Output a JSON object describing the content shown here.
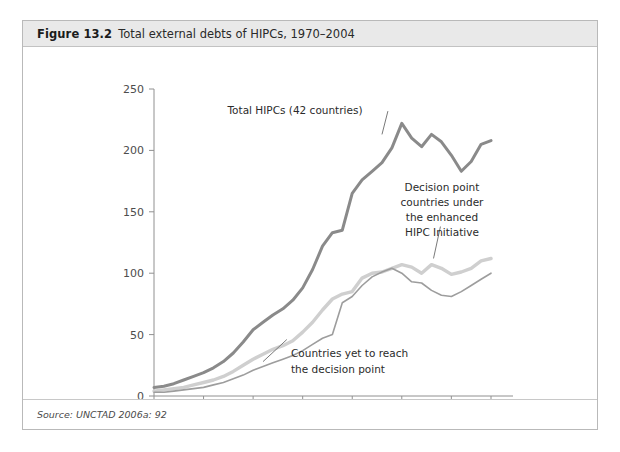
{
  "figure": {
    "number": "Figure 13.2",
    "title": "Total external debts of HIPCs, 1970–2004",
    "source": "Source: UNCTAD 2006a: 92"
  },
  "colors": {
    "total_hipcs": "#8a8a8a",
    "decision_point": "#cfcfcf",
    "yet_to_reach": "#9d9d9d",
    "axis": "#909090",
    "header_bg": "#e9e9e9",
    "border": "#b9b9b9",
    "text": "#2a2a2a"
  },
  "annotations": {
    "total": "Total HIPCs (42 countries)",
    "decision_l1": "Decision point",
    "decision_l2": "countries under",
    "decision_l3": "the enhanced",
    "decision_l4": "HIPC Initiative",
    "yet_l1": "Countries yet to reach",
    "yet_l2": "the decision point"
  },
  "chart_data": {
    "type": "line",
    "title": "Total external debts of HIPCs, 1970–2004",
    "xlabel": "",
    "ylabel": "",
    "xlim": [
      1970,
      2004
    ],
    "ylim": [
      0,
      250
    ],
    "ytick_labels": [
      "0",
      "50",
      "100",
      "150",
      "200",
      "250"
    ],
    "yticks": [
      0,
      50,
      100,
      150,
      200,
      250
    ],
    "xtick_labels": [
      "1970",
      "1975",
      "1980",
      "1985",
      "1990",
      "1995",
      "2000",
      "2004"
    ],
    "xticks": [
      1970,
      1975,
      1980,
      1985,
      1990,
      1995,
      2000,
      2004
    ],
    "grid": false,
    "legend_position": "inline-annotations",
    "x": [
      1970,
      1971,
      1972,
      1973,
      1974,
      1975,
      1976,
      1977,
      1978,
      1979,
      1980,
      1981,
      1982,
      1983,
      1984,
      1985,
      1986,
      1987,
      1988,
      1989,
      1990,
      1991,
      1992,
      1993,
      1994,
      1995,
      1996,
      1997,
      1998,
      1999,
      2000,
      2001,
      2002,
      2003,
      2004
    ],
    "series": [
      {
        "name": "Total HIPCs (42 countries)",
        "color": "#8a8a8a",
        "width": 3.0,
        "values": [
          7,
          8,
          10,
          13,
          16,
          19,
          23,
          28,
          35,
          44,
          54,
          60,
          66,
          71,
          78,
          88,
          103,
          122,
          133,
          135,
          165,
          176,
          183,
          190,
          202,
          222,
          210,
          203,
          213,
          207,
          196,
          183,
          191,
          205,
          208
        ]
      },
      {
        "name": "Decision point countries under the enhanced HIPC Initiative",
        "color": "#cfcfcf",
        "width": 3.4,
        "values": [
          4,
          5,
          6,
          7,
          9,
          11,
          13,
          16,
          20,
          25,
          30,
          34,
          38,
          41,
          45,
          52,
          60,
          70,
          79,
          83,
          85,
          96,
          100,
          101,
          104,
          107,
          105,
          100,
          107,
          104,
          99,
          101,
          104,
          110,
          112
        ]
      },
      {
        "name": "Countries yet to reach the decision point",
        "color": "#9d9d9d",
        "width": 1.6,
        "values": [
          3,
          3,
          4,
          5,
          6,
          7,
          9,
          11,
          14,
          17,
          21,
          24,
          27,
          30,
          33,
          37,
          42,
          47,
          50,
          76,
          81,
          90,
          97,
          101,
          104,
          100,
          93,
          92,
          86,
          82,
          81,
          85,
          90,
          95,
          100
        ]
      }
    ]
  }
}
